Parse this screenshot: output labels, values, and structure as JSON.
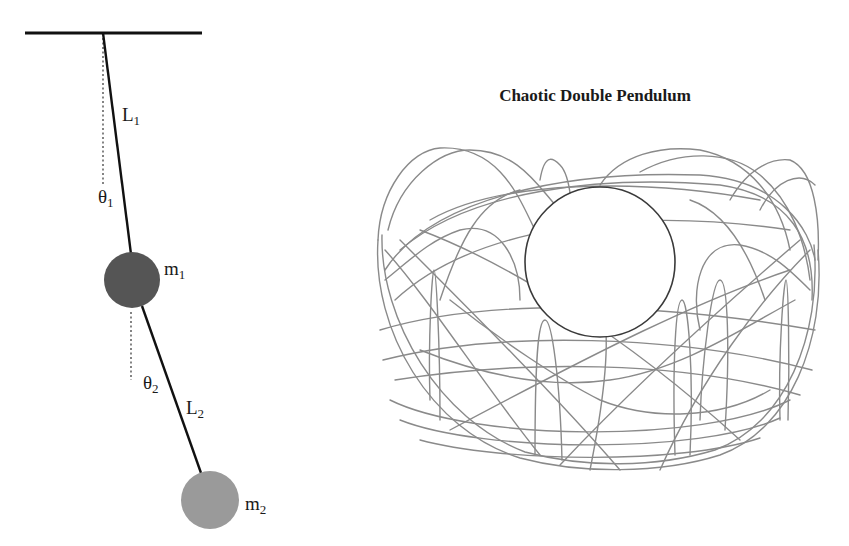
{
  "diagram": {
    "schematic": {
      "ceiling": {
        "x1": 25,
        "x2": 202,
        "y": 33,
        "color": "#111111"
      },
      "pivot": {
        "x": 103,
        "y": 33
      },
      "rod1": {
        "label": "L",
        "subscript": "1",
        "color": "#111111"
      },
      "rod2": {
        "label": "L",
        "subscript": "2",
        "color": "#111111"
      },
      "angle1": {
        "label": "θ",
        "subscript": "1"
      },
      "angle2": {
        "label": "θ",
        "subscript": "2"
      },
      "mass1": {
        "label": "m",
        "subscript": "1",
        "cx": 132,
        "cy": 280,
        "r": 28,
        "color": "#555555"
      },
      "mass2": {
        "label": "m",
        "subscript": "2",
        "cx": 210,
        "cy": 500,
        "r": 29,
        "color": "#9a9a9a"
      }
    },
    "plot": {
      "title": "Chaotic Double Pendulum",
      "trajectory_color": "#8a8a8a",
      "inner_circle": {
        "cx": 600,
        "cy": 262,
        "r": 75,
        "color": "#3a3a3a"
      }
    }
  }
}
